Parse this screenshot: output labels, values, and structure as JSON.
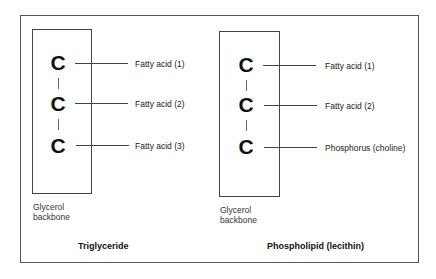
{
  "diagram": {
    "panels": [
      {
        "title": "Triglyceride",
        "backbone_label_line1": "Glycerol",
        "backbone_label_line2": "backbone",
        "carbons": [
          "C",
          "C",
          "C"
        ],
        "attachments": [
          "Fatty acid (1)",
          "Fatty acid (2)",
          "Fatty acid (3)"
        ]
      },
      {
        "title": "Phospholipid (lecithin)",
        "backbone_label_line1": "Glycerol",
        "backbone_label_line2": "backbone",
        "carbons": [
          "C",
          "C",
          "C"
        ],
        "attachments": [
          "Fatty acid (1)",
          "Fatty acid (2)",
          "Phosphorus (choline)"
        ]
      }
    ]
  }
}
